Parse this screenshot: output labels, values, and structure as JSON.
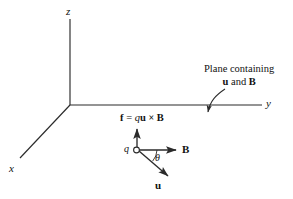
{
  "figure": {
    "background_color": "#ffffff",
    "line_color": "#2b2b2b",
    "text_color": "#111111"
  },
  "axes": {
    "z_label": "z",
    "y_label": "y",
    "x_label": "x"
  },
  "charge": {
    "symbol": "q"
  },
  "angle": {
    "symbol": "θ"
  },
  "vectors": {
    "b_label": "B",
    "u_label": "u"
  },
  "formula": {
    "f": "f",
    "equals": "=",
    "q": "q",
    "u": "u",
    "cross": "×",
    "b": "B"
  },
  "annotation": {
    "line1": "Plane containing",
    "line2_u": "u",
    "line2_and": " and ",
    "line2_b": "B"
  }
}
